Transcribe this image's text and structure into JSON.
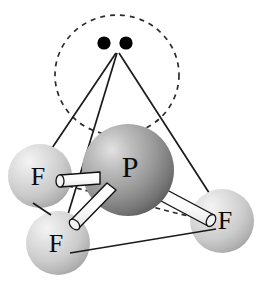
{
  "figure": {
    "molecule_formula": "PF3",
    "background_color": "#ffffff",
    "line_color": "#1a1a1a",
    "dash_color": "#2b2b2b",
    "electron_dot_color": "#000000",
    "bond_fill_color": "#ffffff",
    "bond_outline_color": "#111111"
  },
  "atoms": [
    {
      "id": "p-center",
      "element": "P",
      "label": "P",
      "role": "central-atom",
      "cx": 128,
      "cy": 170,
      "r": 46,
      "color_light": "#d8d8d8",
      "color_mid": "#a3a3a3",
      "color_dark": "#6e6e6e",
      "label_x": 130,
      "label_y": 168
    },
    {
      "id": "f-left",
      "element": "F",
      "label": "F",
      "role": "terminal-atom",
      "cx": 40,
      "cy": 176,
      "r": 32,
      "color_light": "#ececec",
      "color_mid": "#cfcfcf",
      "color_dark": "#a6a6a6",
      "label_x": 38,
      "label_y": 178
    },
    {
      "id": "f-bottom",
      "element": "F",
      "label": "F",
      "role": "terminal-atom",
      "cx": 58,
      "cy": 243,
      "r": 32,
      "color_light": "#ececec",
      "color_mid": "#cfcfcf",
      "color_dark": "#a6a6a6",
      "label_x": 56,
      "label_y": 245
    },
    {
      "id": "f-right",
      "element": "F",
      "label": "F",
      "role": "terminal-atom",
      "cx": 222,
      "cy": 221,
      "r": 32,
      "color_light": "#ececec",
      "color_mid": "#cfcfcf",
      "color_dark": "#a6a6a6",
      "label_x": 224,
      "label_y": 222
    }
  ],
  "lone_pair": {
    "label": "lone pair",
    "apex_x": 116,
    "apex_y": 52,
    "orbital_circle": {
      "cx": 117,
      "cy": 75,
      "rx": 62,
      "ry": 60,
      "dash": "5,5"
    },
    "electrons": [
      {
        "cx": 104,
        "cy": 43,
        "r": 6.5
      },
      {
        "cx": 126,
        "cy": 43,
        "r": 6.5
      }
    ]
  },
  "tetrahedron_edges": [
    {
      "from": "apex",
      "to": "f-left",
      "x1": 116,
      "y1": 52,
      "x2": 44,
      "y2": 157,
      "style": "solid"
    },
    {
      "from": "apex",
      "to": "f-bottom",
      "x1": 117,
      "y1": 52,
      "x2": 62,
      "y2": 232,
      "style": "solid"
    },
    {
      "from": "apex",
      "to": "f-right",
      "x1": 118,
      "y1": 52,
      "x2": 222,
      "y2": 214,
      "style": "solid"
    },
    {
      "from": "f-bottom",
      "to": "f-right",
      "x1": 74,
      "y1": 253,
      "x2": 213,
      "y2": 230,
      "style": "solid"
    },
    {
      "from": "f-left",
      "to": "f-bottom",
      "x1": 35,
      "y1": 205,
      "x2": 53,
      "y2": 214,
      "style": "solid"
    },
    {
      "from": "f-left",
      "to": "f-right",
      "x1": 68,
      "y1": 186,
      "x2": 198,
      "y2": 219,
      "style": "dashed"
    }
  ],
  "bonds": [
    {
      "from": "P",
      "to": "F-left",
      "label": "P-F bond",
      "x1": 119,
      "y1": 180,
      "x2": 52,
      "y2": 182,
      "width": 11
    },
    {
      "from": "P",
      "to": "F-bottom",
      "label": "P-F bond",
      "x1": 120,
      "y1": 192,
      "x2": 74,
      "y2": 232,
      "width": 11
    },
    {
      "from": "P",
      "to": "F-right",
      "label": "P-F bond",
      "x1": 160,
      "y1": 190,
      "x2": 208,
      "y2": 220,
      "width": 11
    }
  ]
}
